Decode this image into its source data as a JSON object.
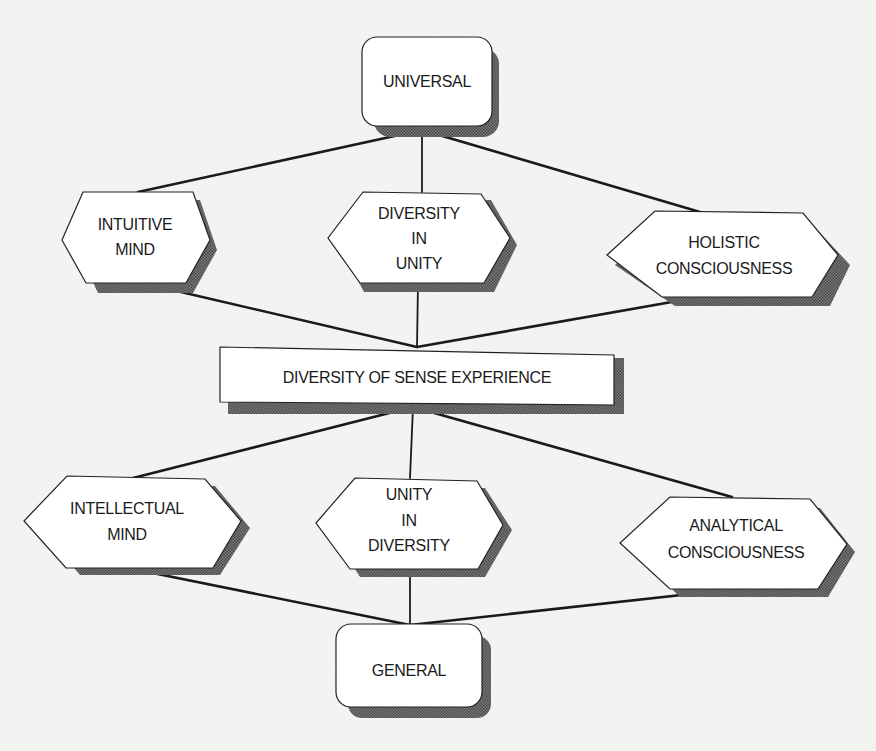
{
  "diagram": {
    "title": "",
    "colors": {
      "background": "#f5f5f3",
      "node_fill": "#ffffff",
      "outline": "#222222",
      "shadow": "#555555",
      "text": "#1a1a1a"
    },
    "nodes": {
      "universal": {
        "label_lines": [
          "UNIVERSAL"
        ],
        "shape": "rounded-rectangle"
      },
      "intuitive_mind": {
        "label_lines": [
          "INTUITIVE",
          "MIND"
        ],
        "shape": "hexagon"
      },
      "diversity_in_unity": {
        "label_lines": [
          "DIVERSITY",
          "IN",
          "UNITY"
        ],
        "shape": "hexagon"
      },
      "holistic_consciousness": {
        "label_lines": [
          "HOLISTIC",
          "CONSCIOUSNESS"
        ],
        "shape": "hexagon"
      },
      "diversity_of_sense_experience": {
        "label_lines": [
          "DIVERSITY OF SENSE EXPERIENCE"
        ],
        "shape": "rectangle"
      },
      "intellectual_mind": {
        "label_lines": [
          "INTELLECTUAL",
          "MIND"
        ],
        "shape": "hexagon"
      },
      "unity_in_diversity": {
        "label_lines": [
          "UNITY",
          "IN",
          "DIVERSITY"
        ],
        "shape": "hexagon"
      },
      "analytical_consciousness": {
        "label_lines": [
          "ANALYTICAL",
          "CONSCIOUSNESS"
        ],
        "shape": "hexagon"
      },
      "general": {
        "label_lines": [
          "GENERAL"
        ],
        "shape": "rounded-rectangle"
      }
    },
    "edges": [
      {
        "from": "universal",
        "to": "intuitive_mind"
      },
      {
        "from": "universal",
        "to": "diversity_in_unity"
      },
      {
        "from": "universal",
        "to": "holistic_consciousness"
      },
      {
        "from": "intuitive_mind",
        "to": "diversity_of_sense_experience"
      },
      {
        "from": "diversity_in_unity",
        "to": "diversity_of_sense_experience"
      },
      {
        "from": "holistic_consciousness",
        "to": "diversity_of_sense_experience"
      },
      {
        "from": "diversity_of_sense_experience",
        "to": "intellectual_mind"
      },
      {
        "from": "diversity_of_sense_experience",
        "to": "unity_in_diversity"
      },
      {
        "from": "diversity_of_sense_experience",
        "to": "analytical_consciousness"
      },
      {
        "from": "intellectual_mind",
        "to": "general"
      },
      {
        "from": "unity_in_diversity",
        "to": "general"
      },
      {
        "from": "analytical_consciousness",
        "to": "general"
      }
    ]
  }
}
